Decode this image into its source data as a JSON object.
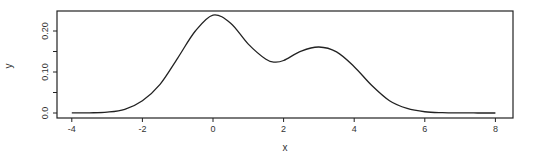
{
  "chart_data": {
    "type": "line",
    "title": "",
    "xlabel": "x",
    "ylabel": "y",
    "xlim": [
      -4.4,
      8.5
    ],
    "ylim": [
      -0.01,
      0.25
    ],
    "xticks": [
      -4,
      -2,
      0,
      2,
      4,
      6,
      8
    ],
    "xtick_labels": [
      "-4",
      "-2",
      "0",
      "2",
      "4",
      "6",
      "8"
    ],
    "yticks": [
      0.0,
      0.05,
      0.1,
      0.15,
      0.2
    ],
    "ytick_labels": [
      "0.0",
      "",
      "0.10",
      "",
      "0.20"
    ],
    "grid": false,
    "legend": null,
    "series": [
      {
        "name": "density",
        "x": [
          -4,
          -3.5,
          -3,
          -2.5,
          -2,
          -1.5,
          -1,
          -0.5,
          0,
          0.5,
          1,
          1.5,
          1.75,
          2,
          2.5,
          3,
          3.5,
          4,
          4.5,
          5,
          5.5,
          6,
          6.5,
          7,
          7.5,
          8
        ],
        "values": [
          0.0001,
          0.0004,
          0.002,
          0.009,
          0.03,
          0.07,
          0.134,
          0.2,
          0.239,
          0.219,
          0.168,
          0.131,
          0.124,
          0.128,
          0.151,
          0.161,
          0.149,
          0.113,
          0.067,
          0.03,
          0.011,
          0.003,
          0.0008,
          0.0002,
          5e-05,
          1e-05
        ]
      }
    ]
  }
}
